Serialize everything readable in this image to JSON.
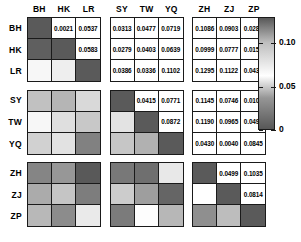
{
  "chart_data": {
    "type": "heatmap",
    "title": "",
    "xlabel": "",
    "ylabel": "",
    "grid": true,
    "legend_position": "right",
    "labels": [
      "BH",
      "HK",
      "LR",
      "SY",
      "TW",
      "YQ",
      "ZH",
      "ZJ",
      "ZP"
    ],
    "row_labels": [
      "BH",
      "HK",
      "LR",
      "SY",
      "TW",
      "YQ",
      "ZH",
      "ZJ",
      "ZP"
    ],
    "col_labels": [
      "BH",
      "HK",
      "LR",
      "SY",
      "TW",
      "YQ",
      "ZH",
      "ZJ",
      "ZP"
    ],
    "block_groups": [
      [
        "BH",
        "HK",
        "LR"
      ],
      [
        "SY",
        "TW",
        "YQ"
      ],
      [
        "ZH",
        "ZJ",
        "ZP"
      ]
    ],
    "colorbar": {
      "ticks": [
        "0.10",
        "0.05",
        "0"
      ],
      "tick_values": [
        0.1,
        0.05,
        0
      ],
      "min": 0,
      "max": 0.13,
      "colormap": "grayscale-bone-reversed"
    },
    "note": "Upper triangle shows printed pairwise values; lower triangle shows the same values as grayscale shading; diagonal is dark (self-comparison).",
    "values": [
      [
        null,
        0.0021,
        0.0537,
        0.0313,
        0.0477,
        0.0719,
        0.1086,
        0.0903,
        0.0287
      ],
      [
        0.0021,
        null,
        0.0583,
        0.0279,
        0.0403,
        0.0639,
        0.0999,
        0.0777,
        0.0155
      ],
      [
        0.0537,
        0.0583,
        null,
        0.0386,
        0.0336,
        0.1102,
        0.1295,
        0.1122,
        0.0438
      ],
      [
        0.0313,
        0.0279,
        0.0386,
        null,
        0.0415,
        0.0771,
        0.1145,
        0.0746,
        0.0106
      ],
      [
        0.0477,
        0.0403,
        0.0336,
        0.0415,
        null,
        0.0872,
        0.119,
        0.0965,
        0.0494
      ],
      [
        0.0719,
        0.0639,
        0.1102,
        0.0771,
        0.0872,
        null,
        0.043,
        0.004,
        0.0845
      ],
      [
        0.1086,
        0.0999,
        0.1295,
        0.1145,
        0.119,
        0.043,
        null,
        0.0499,
        0.1035
      ],
      [
        0.0903,
        0.0777,
        0.1122,
        0.0746,
        0.0965,
        0.004,
        0.0499,
        null,
        0.0814
      ],
      [
        0.0287,
        0.0155,
        0.0438,
        0.0106,
        0.0494,
        0.0845,
        0.1035,
        0.0814,
        null
      ]
    ],
    "cell_text": [
      [
        "",
        "0.0021",
        "0.0537",
        "0.0313",
        "0.0477",
        "0.0719",
        "0.1086",
        "0.0903",
        "0.0287"
      ],
      [
        "",
        "",
        "0.0583",
        "0.0279",
        "0.0403",
        "0.0639",
        "0.0999",
        "0.0777",
        "0.0155"
      ],
      [
        "",
        "",
        "",
        "0.0386",
        "0.0336",
        "0.1102",
        "0.1295",
        "0.1122",
        "0.0438"
      ],
      [
        "",
        "",
        "",
        "",
        "0.0415",
        "0.0771",
        "0.1145",
        "0.0746",
        "0.0106"
      ],
      [
        "",
        "",
        "",
        "",
        "",
        "0.0872",
        "0.1190",
        "0.0965",
        "0.0494"
      ],
      [
        "",
        "",
        "",
        "",
        "",
        "",
        "0.0430",
        "0.0040",
        "0.0845"
      ],
      [
        "",
        "",
        "",
        "",
        "",
        "",
        "",
        "0.0499",
        "0.1035"
      ],
      [
        "",
        "",
        "",
        "",
        "",
        "",
        "",
        "",
        "0.0814"
      ],
      [
        "",
        "",
        "",
        "",
        "",
        "",
        "",
        "",
        ""
      ]
    ]
  },
  "colors": {
    "background": "#ffffff",
    "grid_line": "#1a1a1a",
    "text": "#000000",
    "shade_dark": "#606060",
    "shade_light": "#ffffff",
    "diagonal": "#5a5a5a"
  }
}
